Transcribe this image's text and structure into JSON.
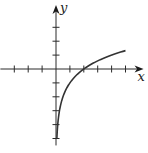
{
  "chart_data": {
    "type": "line",
    "title": "",
    "xlabel": "x",
    "ylabel": "y",
    "function": "y = log2(x) - 1",
    "xlim": [
      -4,
      6.3
    ],
    "ylim": [
      -5.5,
      4.6
    ],
    "x_ticks": [
      -3,
      -2,
      -1,
      1,
      2,
      3,
      4,
      5
    ],
    "y_ticks": [
      -5,
      -4,
      -3,
      -2,
      -1,
      1,
      2,
      3
    ],
    "tick_labels_shown": false,
    "grid": false,
    "series": [
      {
        "name": "curve",
        "x": [
          0.0625,
          0.09,
          0.125,
          0.18,
          0.25,
          0.35,
          0.5,
          0.7,
          1,
          1.4,
          2,
          2.5,
          3,
          3.5,
          4,
          4.5,
          5
        ],
        "y": [
          -5,
          -4.47,
          -4,
          -3.47,
          -3,
          -2.51,
          -2,
          -1.51,
          -1,
          -0.51,
          0,
          0.32,
          0.58,
          0.81,
          1,
          1.17,
          1.32
        ]
      }
    ],
    "key_points": [
      {
        "x": 2,
        "y": 0,
        "note": "x-intercept"
      },
      {
        "x": 1,
        "y": -1
      },
      {
        "x": 0.5,
        "y": -2
      }
    ]
  }
}
